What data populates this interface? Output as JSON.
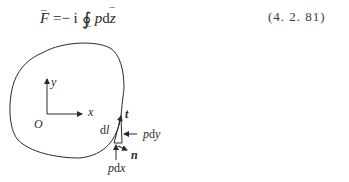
{
  "equation": {
    "lhs": "F",
    "equals": "=",
    "minus": "−",
    "imag_unit": "i",
    "integral": "∮",
    "contour": "L",
    "integrand_p": "p",
    "differential": "d",
    "variable": "z",
    "number": "(4. 2. 81)"
  },
  "figure": {
    "axis_x": "x",
    "axis_y": "y",
    "origin": "O",
    "tangent": "t",
    "normal": "n",
    "element": "dl",
    "force_y": "pdy",
    "force_x": "pdx"
  }
}
